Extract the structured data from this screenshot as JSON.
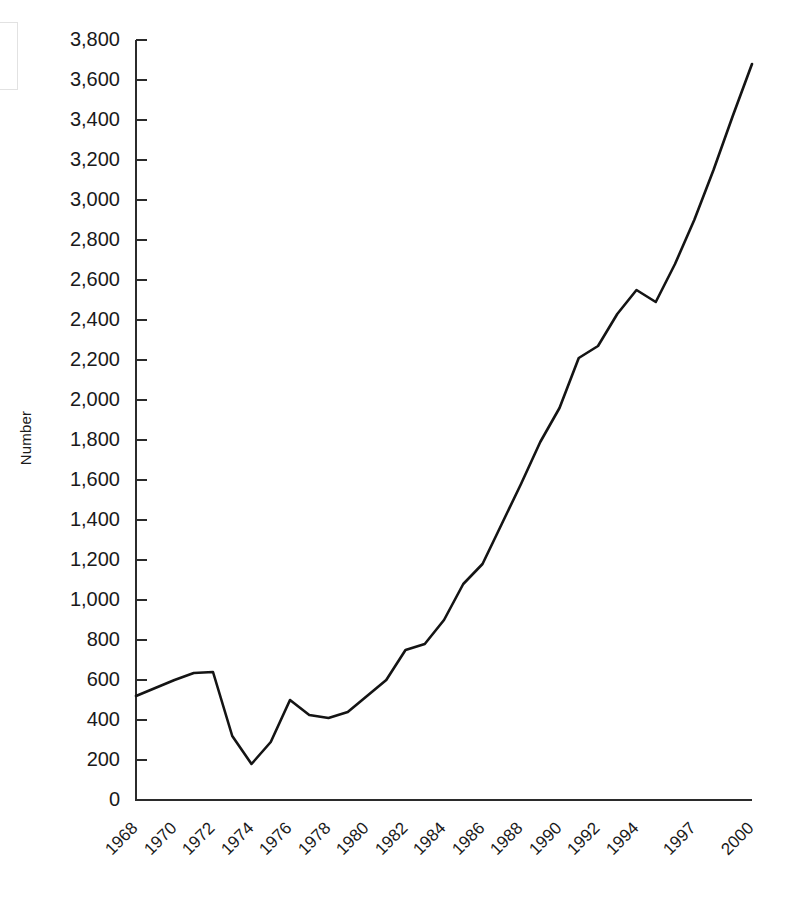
{
  "chart_data": {
    "type": "line",
    "title": "",
    "xlabel": "",
    "ylabel": "Number",
    "ylim": [
      0,
      3800
    ],
    "ytick_step": 200,
    "grid": false,
    "legend": false,
    "line_color": "#141414",
    "axis_color": "#2b2b2b",
    "ytick_labels": [
      "3,800",
      "3,600",
      "3,400",
      "3,200",
      "3,000",
      "2,800",
      "2,600",
      "2,400",
      "2,200",
      "2,000",
      "1,800",
      "1,600",
      "1,400",
      "1,200",
      "1,000",
      "800",
      "600",
      "400",
      "200",
      "0"
    ],
    "ytick_values": [
      3800,
      3600,
      3400,
      3200,
      3000,
      2800,
      2600,
      2400,
      2200,
      2000,
      1800,
      1600,
      1400,
      1200,
      1000,
      800,
      600,
      400,
      200,
      0
    ],
    "xtick_labels": [
      "1968",
      "1970",
      "1972",
      "1974",
      "1976",
      "1978",
      "1980",
      "1982",
      "1984",
      "1986",
      "1988",
      "1990",
      "1992",
      "1994",
      "1997",
      "2000"
    ],
    "x": [
      1968,
      1969,
      1970,
      1971,
      1972,
      1973,
      1974,
      1975,
      1976,
      1977,
      1978,
      1979,
      1980,
      1981,
      1982,
      1983,
      1984,
      1985,
      1986,
      1987,
      1988,
      1989,
      1990,
      1991,
      1992,
      1993,
      1994,
      1995,
      1996,
      1997,
      1998,
      1999,
      2000
    ],
    "values": [
      520,
      560,
      600,
      635,
      640,
      320,
      180,
      290,
      500,
      425,
      410,
      440,
      520,
      600,
      750,
      780,
      900,
      1080,
      1180,
      1380,
      1580,
      1790,
      1960,
      2210,
      2270,
      2430,
      2550,
      2490,
      2680,
      2900,
      3150,
      3420,
      3680
    ],
    "xtick_label_positions": [
      1968,
      1970,
      1972,
      1974,
      1976,
      1978,
      1980,
      1982,
      1984,
      1986,
      1988,
      1990,
      1992,
      1994,
      1997,
      2000
    ]
  }
}
